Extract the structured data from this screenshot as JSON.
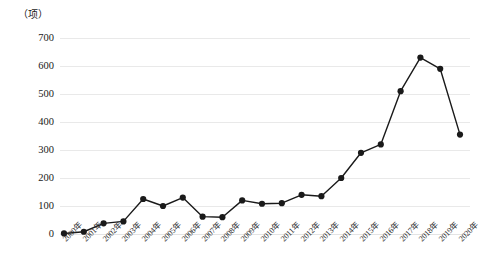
{
  "chart_data": {
    "type": "line",
    "title": "",
    "subtitle": "",
    "xlabel": "",
    "ylabel": "",
    "unit_label": "（项）",
    "categories": [
      "2000年",
      "2001年",
      "2002年",
      "2003年",
      "2004年",
      "2005年",
      "2006年",
      "2007年",
      "2008年",
      "2009年",
      "2010年",
      "2011年",
      "2012年",
      "2013年",
      "2014年",
      "2015年",
      "2016年",
      "2017年",
      "2018年",
      "2019年",
      "2020年"
    ],
    "values": [
      2,
      8,
      38,
      45,
      125,
      100,
      130,
      62,
      60,
      120,
      108,
      110,
      140,
      135,
      200,
      290,
      320,
      510,
      630,
      590,
      355
    ],
    "ylim": [
      0,
      700
    ],
    "ytick_labels": [
      "700",
      "600",
      "500",
      "400",
      "300",
      "200",
      "100",
      "0"
    ],
    "ytick_values": [
      700,
      600,
      500,
      400,
      300,
      200,
      100,
      0
    ],
    "ystep": 100,
    "grid": true,
    "grid_axis": "y",
    "legend": false,
    "legend_position": "none",
    "series": [
      {
        "name": "",
        "values": [
          2,
          8,
          38,
          45,
          125,
          100,
          130,
          62,
          60,
          120,
          108,
          110,
          140,
          135,
          200,
          290,
          320,
          510,
          630,
          590,
          355
        ]
      }
    ],
    "colors": {
      "line": "#1a1a1a",
      "marker": "#1a1a1a",
      "grid": "#e9e9e9",
      "background": "#ffffff",
      "text": "#1a1a1a"
    },
    "marker": "circle",
    "marker_size": 3.1,
    "line_width": 1.4
  }
}
